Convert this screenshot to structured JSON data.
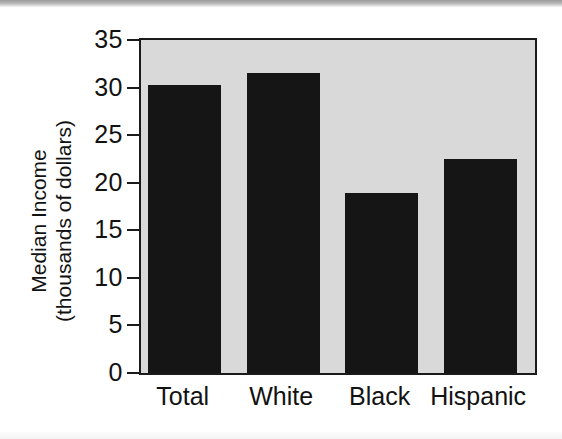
{
  "chart_data": {
    "type": "bar",
    "title": "",
    "xlabel": "",
    "ylabel": "Median Income (thousands of dollars)",
    "ylabel_lines": [
      "Median Income",
      "(thousands of dollars)"
    ],
    "categories": [
      "Total",
      "White",
      "Black",
      "Hispanic"
    ],
    "values": [
      30.3,
      31.5,
      18.9,
      22.5
    ],
    "ylim": [
      0,
      35
    ],
    "yticks": [
      0,
      5,
      10,
      15,
      20,
      25,
      30,
      35
    ],
    "ytick_labels": [
      "0",
      "5",
      "10",
      "15",
      "20",
      "25",
      "30",
      "35"
    ],
    "grid": false,
    "legend": null,
    "series": [
      {
        "name": "Median Income",
        "values": [
          30.3,
          31.5,
          18.9,
          22.5
        ]
      }
    ]
  },
  "style": {
    "bar_color": "#151515",
    "plot_background": "#d9d9d9",
    "axis_color": "#1a1a1a",
    "page_background": "#ffffff",
    "text_color": "#121212"
  }
}
